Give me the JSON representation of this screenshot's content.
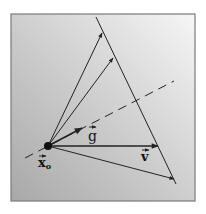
{
  "figure": {
    "labels": {
      "origin": "x",
      "origin_subscript": "o",
      "gradient": "g",
      "velocity": "v"
    },
    "colors": {
      "background_light": "#f4f4f4",
      "background_dark": "#a9a9a9",
      "frame": "#7a7a7a",
      "ink": "#222222"
    }
  }
}
